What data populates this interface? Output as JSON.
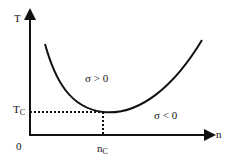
{
  "diagram": {
    "y_axis_label": "T",
    "x_axis_label": "n",
    "origin_label": "0",
    "tc_label": {
      "main": "T",
      "sub": "C"
    },
    "nc_label": {
      "main": "n",
      "sub": "C"
    },
    "region_above": "σ > 0",
    "region_below": "σ < 0",
    "colors": {
      "line": "#111111",
      "background": "#ffffff"
    }
  }
}
